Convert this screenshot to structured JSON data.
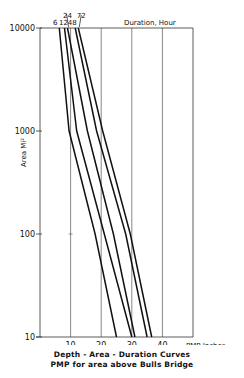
{
  "chart_data": {
    "type": "line",
    "title": "Depth - Area - Duration Curves",
    "subtitle": "PMP for area above Bulls Bridge",
    "xlabel": "PMP Inches",
    "ylabel": "Area Mi²",
    "legend_title": "Duration, Hour",
    "xlim": [
      0,
      50
    ],
    "ylim": [
      10,
      10000
    ],
    "yscale": "log",
    "grid": "vertical",
    "x_ticks": [
      10,
      20,
      30,
      40
    ],
    "x_tick_labels": [
      "10",
      "20",
      "30",
      "40"
    ],
    "y_ticks": [
      10,
      100,
      1000,
      10000
    ],
    "y_tick_labels": [
      "10",
      "100",
      "1000",
      "10000"
    ],
    "series": [
      {
        "name": "6",
        "points": [
          {
            "x": 6.3,
            "y": 10000
          },
          {
            "x": 9.5,
            "y": 1000
          },
          {
            "x": 18,
            "y": 100
          },
          {
            "x": 25,
            "y": 10
          }
        ]
      },
      {
        "name": "12",
        "points": [
          {
            "x": 8,
            "y": 10000
          },
          {
            "x": 12,
            "y": 1000
          },
          {
            "x": 21,
            "y": 100
          },
          {
            "x": 30,
            "y": 10
          }
        ]
      },
      {
        "name": "24",
        "points": [
          {
            "x": 9,
            "y": 10000
          },
          {
            "x": 15.5,
            "y": 1000
          },
          {
            "x": 24,
            "y": 100
          },
          {
            "x": 31,
            "y": 10
          }
        ]
      },
      {
        "name": "48",
        "points": [
          {
            "x": 11.5,
            "y": 10000
          },
          {
            "x": 18.5,
            "y": 1000
          },
          {
            "x": 28,
            "y": 100
          },
          {
            "x": 35,
            "y": 10
          }
        ]
      },
      {
        "name": "72",
        "points": [
          {
            "x": 12.5,
            "y": 10000
          },
          {
            "x": 20.5,
            "y": 1000
          },
          {
            "x": 29.5,
            "y": 100
          },
          {
            "x": 36.5,
            "y": 10
          }
        ]
      }
    ]
  }
}
